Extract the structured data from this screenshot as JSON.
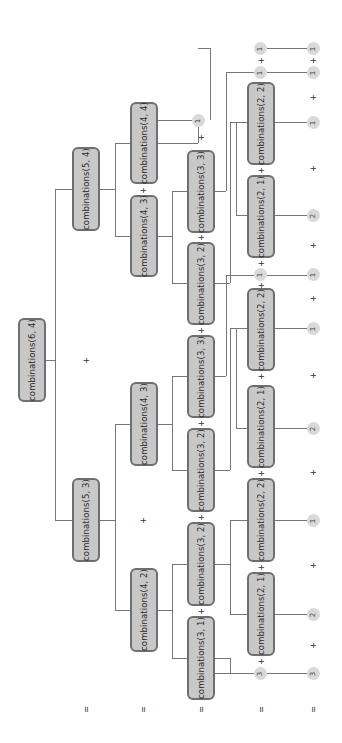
{
  "colors": {
    "node_fill": "#c8c8c8",
    "node_border": "#6f6f6f",
    "leaf_fill": "#d9d9d9",
    "line": "#777777"
  },
  "orientation": "rotated-90-clockwise",
  "nodes": [
    {
      "id": "n0",
      "label": "combinations(6, 4)",
      "x": 18,
      "y": 318,
      "w": 28,
      "h": 84
    },
    {
      "id": "n1",
      "label": "combinations(5, 4)",
      "x": 72,
      "y": 147,
      "w": 28,
      "h": 84
    },
    {
      "id": "n2",
      "label": "combinations(5, 3)",
      "x": 72,
      "y": 478,
      "w": 28,
      "h": 84
    },
    {
      "id": "n3",
      "label": "combinations(4, 4)",
      "x": 130,
      "y": 102,
      "w": 28,
      "h": 82
    },
    {
      "id": "n4",
      "label": "combinations(4, 3)",
      "x": 130,
      "y": 195,
      "w": 28,
      "h": 82
    },
    {
      "id": "n5",
      "label": "combinations(4, 3)",
      "x": 130,
      "y": 382,
      "w": 28,
      "h": 84
    },
    {
      "id": "n6",
      "label": "combinations(4, 2)",
      "x": 130,
      "y": 568,
      "w": 28,
      "h": 84
    },
    {
      "id": "n7",
      "label": "combinations(3, 3)",
      "x": 187,
      "y": 150,
      "w": 28,
      "h": 83
    },
    {
      "id": "n8",
      "label": "combinations(3, 2)",
      "x": 187,
      "y": 242,
      "w": 28,
      "h": 83
    },
    {
      "id": "n9",
      "label": "combinations(3, 3)",
      "x": 187,
      "y": 335,
      "w": 28,
      "h": 83
    },
    {
      "id": "n10",
      "label": "combinations(3, 2)",
      "x": 187,
      "y": 428,
      "w": 28,
      "h": 84
    },
    {
      "id": "n11",
      "label": "combinations(3, 2)",
      "x": 187,
      "y": 522,
      "w": 28,
      "h": 84
    },
    {
      "id": "n12",
      "label": "combinations(3, 1)",
      "x": 187,
      "y": 616,
      "w": 28,
      "h": 84
    },
    {
      "id": "n13",
      "label": "combinations(2, 2)",
      "x": 247,
      "y": 82,
      "w": 28,
      "h": 83
    },
    {
      "id": "n14",
      "label": "combinations(2, 1)",
      "x": 247,
      "y": 175,
      "w": 28,
      "h": 83
    },
    {
      "id": "n15",
      "label": "combinations(2, 2)",
      "x": 247,
      "y": 288,
      "w": 28,
      "h": 83
    },
    {
      "id": "n16",
      "label": "combinations(2, 1)",
      "x": 247,
      "y": 385,
      "w": 28,
      "h": 83
    },
    {
      "id": "n17",
      "label": "combinations(2, 2)",
      "x": 247,
      "y": 478,
      "w": 28,
      "h": 84
    },
    {
      "id": "n18",
      "label": "combinations(2, 1)",
      "x": 247,
      "y": 572,
      "w": 28,
      "h": 84
    }
  ],
  "leaves": [
    {
      "value": "1",
      "x": 192,
      "y": 114
    },
    {
      "value": "1",
      "x": 254,
      "y": 42
    },
    {
      "value": "1",
      "x": 254,
      "y": 66
    },
    {
      "value": "1",
      "x": 254,
      "y": 268
    },
    {
      "value": "3",
      "x": 254,
      "y": 667
    },
    {
      "value": "1",
      "x": 307,
      "y": 42
    },
    {
      "value": "1",
      "x": 307,
      "y": 66
    },
    {
      "value": "1",
      "x": 307,
      "y": 116
    },
    {
      "value": "2",
      "x": 307,
      "y": 209
    },
    {
      "value": "1",
      "x": 307,
      "y": 268
    },
    {
      "value": "1",
      "x": 307,
      "y": 322
    },
    {
      "value": "2",
      "x": 307,
      "y": 422
    },
    {
      "value": "1",
      "x": 307,
      "y": 514
    },
    {
      "value": "2",
      "x": 307,
      "y": 608
    },
    {
      "value": "3",
      "x": 307,
      "y": 667
    }
  ],
  "operators": [
    {
      "sym": "+",
      "x": 81,
      "y": 355
    },
    {
      "sym": "+",
      "x": 138,
      "y": 185
    },
    {
      "sym": "+",
      "x": 138,
      "y": 515
    },
    {
      "sym": "+",
      "x": 196,
      "y": 132
    },
    {
      "sym": "+",
      "x": 196,
      "y": 232
    },
    {
      "sym": "+",
      "x": 196,
      "y": 325
    },
    {
      "sym": "+",
      "x": 196,
      "y": 418
    },
    {
      "sym": "+",
      "x": 196,
      "y": 512
    },
    {
      "sym": "+",
      "x": 196,
      "y": 606
    },
    {
      "sym": "+",
      "x": 256,
      "y": 55
    },
    {
      "sym": "+",
      "x": 256,
      "y": 165
    },
    {
      "sym": "+",
      "x": 256,
      "y": 258
    },
    {
      "sym": "+",
      "x": 256,
      "y": 280
    },
    {
      "sym": "+",
      "x": 256,
      "y": 371
    },
    {
      "sym": "+",
      "x": 256,
      "y": 468
    },
    {
      "sym": "+",
      "x": 256,
      "y": 562
    },
    {
      "sym": "+",
      "x": 256,
      "y": 656
    },
    {
      "sym": "+",
      "x": 308,
      "y": 55
    },
    {
      "sym": "+",
      "x": 308,
      "y": 92
    },
    {
      "sym": "+",
      "x": 308,
      "y": 163
    },
    {
      "sym": "+",
      "x": 308,
      "y": 240
    },
    {
      "sym": "+",
      "x": 308,
      "y": 293
    },
    {
      "sym": "+",
      "x": 308,
      "y": 370
    },
    {
      "sym": "+",
      "x": 308,
      "y": 467
    },
    {
      "sym": "+",
      "x": 308,
      "y": 560
    },
    {
      "sym": "+",
      "x": 308,
      "y": 640
    },
    {
      "sym": "=",
      "x": 81,
      "y": 704
    },
    {
      "sym": "=",
      "x": 138,
      "y": 704
    },
    {
      "sym": "=",
      "x": 196,
      "y": 704
    },
    {
      "sym": "=",
      "x": 256,
      "y": 704
    },
    {
      "sym": "=",
      "x": 308,
      "y": 704
    }
  ],
  "edges": [
    [
      46,
      360,
      55,
      360
    ],
    [
      55,
      189,
      55,
      520
    ],
    [
      55,
      189,
      72,
      189
    ],
    [
      55,
      520,
      72,
      520
    ],
    [
      100,
      189,
      115,
      189
    ],
    [
      115,
      143,
      115,
      236
    ],
    [
      115,
      143,
      130,
      143
    ],
    [
      115,
      236,
      130,
      236
    ],
    [
      100,
      520,
      115,
      520
    ],
    [
      115,
      424,
      115,
      610
    ],
    [
      115,
      424,
      130,
      424
    ],
    [
      115,
      610,
      130,
      610
    ],
    [
      158,
      143,
      198,
      143
    ],
    [
      198,
      120,
      198,
      143
    ],
    [
      198,
      48,
      210,
      48
    ],
    [
      210,
      48,
      210,
      120
    ],
    [
      158,
      236,
      172,
      236
    ],
    [
      172,
      191,
      172,
      283
    ],
    [
      172,
      191,
      187,
      191
    ],
    [
      172,
      283,
      187,
      283
    ],
    [
      158,
      424,
      172,
      424
    ],
    [
      172,
      376,
      172,
      470
    ],
    [
      172,
      376,
      187,
      376
    ],
    [
      172,
      470,
      187,
      470
    ],
    [
      158,
      610,
      172,
      610
    ],
    [
      172,
      564,
      172,
      658
    ],
    [
      172,
      564,
      187,
      564
    ],
    [
      172,
      658,
      187,
      658
    ],
    [
      215,
      191,
      226,
      191
    ],
    [
      226,
      72,
      226,
      191
    ],
    [
      226,
      72,
      254,
      72
    ],
    [
      215,
      283,
      230,
      283
    ],
    [
      230,
      122,
      230,
      283
    ],
    [
      230,
      122,
      247,
      122
    ],
    [
      236,
      122,
      236,
      215
    ],
    [
      236,
      215,
      247,
      215
    ],
    [
      215,
      376,
      226,
      376
    ],
    [
      226,
      275,
      226,
      376
    ],
    [
      226,
      275,
      254,
      275
    ],
    [
      215,
      470,
      230,
      470
    ],
    [
      230,
      328,
      230,
      470
    ],
    [
      230,
      328,
      247,
      328
    ],
    [
      236,
      328,
      236,
      428
    ],
    [
      236,
      428,
      247,
      428
    ],
    [
      215,
      564,
      230,
      564
    ],
    [
      230,
      520,
      230,
      614
    ],
    [
      230,
      520,
      247,
      520
    ],
    [
      230,
      614,
      247,
      614
    ],
    [
      215,
      658,
      230,
      658
    ],
    [
      230,
      673,
      230,
      658
    ],
    [
      215,
      673,
      254,
      673
    ],
    [
      267,
      48,
      307,
      48
    ],
    [
      267,
      72,
      307,
      72
    ],
    [
      275,
      122,
      307,
      122
    ],
    [
      275,
      215,
      307,
      215
    ],
    [
      267,
      275,
      307,
      275
    ],
    [
      275,
      328,
      307,
      328
    ],
    [
      275,
      428,
      307,
      428
    ],
    [
      275,
      520,
      307,
      520
    ],
    [
      275,
      614,
      307,
      614
    ],
    [
      267,
      673,
      307,
      673
    ],
    [
      158,
      120,
      192,
      120
    ]
  ]
}
